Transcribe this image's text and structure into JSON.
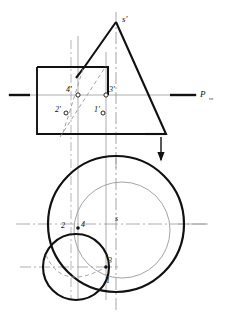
{
  "figure": {
    "title_visible": false,
    "kind": "descriptive-geometry-cone-plane-intersection",
    "colors": {
      "object_line": "#111111",
      "thin_line": "#8a8a8a",
      "center_line": "#9a9a9a",
      "dash_line": "#9a9a9a",
      "background": "#ffffff"
    }
  },
  "front_view": {
    "apex_label": "s'",
    "plane_trace_label": "P",
    "plane_trace_subscript": "vz",
    "point_labels": [
      {
        "id": "p4f",
        "text": "4'"
      },
      {
        "id": "p3f",
        "text": "3'"
      },
      {
        "id": "p2f",
        "text": "2'"
      },
      {
        "id": "p1f",
        "text": "1'"
      }
    ]
  },
  "top_view": {
    "center_label": "s",
    "point_labels": [
      {
        "id": "p2t",
        "text": "2"
      },
      {
        "id": "p4t",
        "text": "4"
      },
      {
        "id": "p3t",
        "text": "3"
      },
      {
        "id": "p1t",
        "text": "1"
      }
    ]
  },
  "annotations": {
    "projection_arrow": "down-arrow"
  }
}
